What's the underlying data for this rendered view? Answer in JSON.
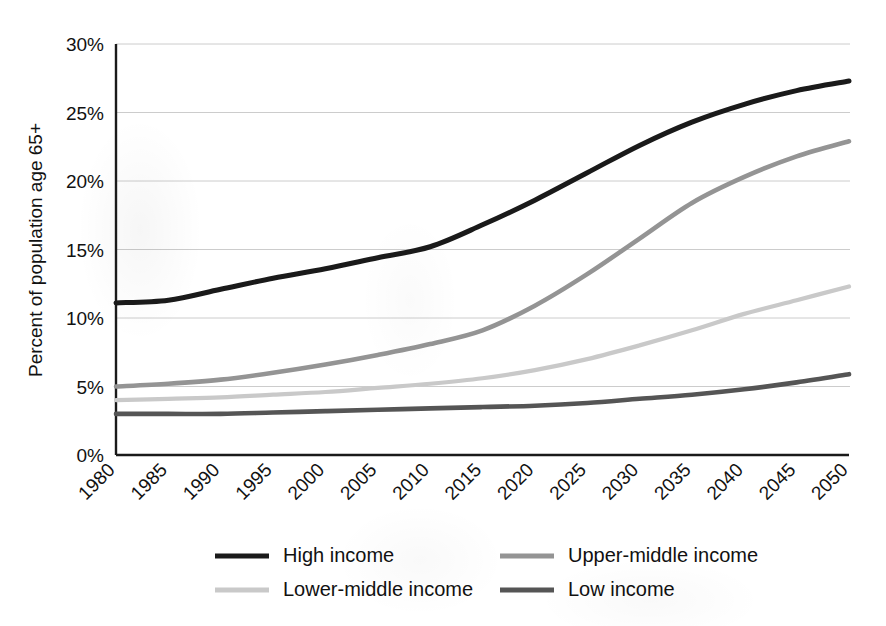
{
  "chart_data": {
    "type": "line",
    "title": "",
    "xlabel": "",
    "ylabel": "Percent of population age 65+",
    "xlim": [
      1980,
      2050
    ],
    "ylim": [
      0,
      30
    ],
    "ytick_step": 5,
    "grid": "horizontal",
    "legend_position": "bottom",
    "x": [
      1980,
      1985,
      1990,
      1995,
      2000,
      2005,
      2010,
      2015,
      2020,
      2025,
      2030,
      2035,
      2040,
      2045,
      2050
    ],
    "xtick_labels": [
      "1980",
      "1985",
      "1990",
      "1995",
      "2000",
      "2005",
      "2010",
      "2015",
      "2020",
      "2025",
      "2030",
      "2035",
      "2040",
      "2045",
      "2050"
    ],
    "ytick_labels": [
      "0%",
      "5%",
      "10%",
      "15%",
      "20%",
      "25%",
      "30%"
    ],
    "ytick_values": [
      0,
      5,
      10,
      15,
      20,
      25,
      30
    ],
    "series": [
      {
        "name": "High income",
        "color": "#1a1a1a",
        "width": 5.0,
        "values": [
          11.1,
          11.3,
          12.1,
          12.9,
          13.6,
          14.4,
          15.2,
          16.8,
          18.6,
          20.6,
          22.6,
          24.3,
          25.6,
          26.6,
          27.3
        ]
      },
      {
        "name": "Upper-middle income",
        "color": "#949494",
        "width": 4.6,
        "values": [
          5.0,
          5.2,
          5.5,
          6.0,
          6.6,
          7.3,
          8.1,
          9.1,
          10.9,
          13.2,
          15.8,
          18.4,
          20.3,
          21.8,
          22.9
        ]
      },
      {
        "name": "Lower-middle income",
        "color": "#c9c9c9",
        "width": 4.2,
        "values": [
          4.0,
          4.1,
          4.2,
          4.4,
          4.6,
          4.9,
          5.2,
          5.6,
          6.2,
          7.0,
          8.0,
          9.1,
          10.3,
          11.3,
          12.3
        ]
      },
      {
        "name": "Low income",
        "color": "#555555",
        "width": 4.6,
        "values": [
          3.0,
          3.0,
          3.0,
          3.1,
          3.2,
          3.3,
          3.4,
          3.5,
          3.6,
          3.8,
          4.1,
          4.4,
          4.8,
          5.3,
          5.9
        ]
      }
    ]
  },
  "axes": {
    "y_title": "Percent of population age 65+",
    "axis_color": "#1a1a1a",
    "grid_color": "#cccccc"
  },
  "legend": {
    "entries": [
      {
        "label": "High income",
        "color": "#1a1a1a"
      },
      {
        "label": "Upper-middle income",
        "color": "#949494"
      },
      {
        "label": "Lower-middle income",
        "color": "#c9c9c9"
      },
      {
        "label": "Low income",
        "color": "#555555"
      }
    ]
  }
}
